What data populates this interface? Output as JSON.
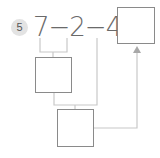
{
  "problem": {
    "number": "5",
    "expression": "7−2−4=",
    "operands": [
      "7",
      "2",
      "4"
    ],
    "operator": "−",
    "equals": "="
  },
  "boxes": {
    "result": "",
    "step1": "",
    "step2": ""
  },
  "colors": {
    "box_border": "#8a8a8a",
    "connector": "#c8c8c8",
    "badge_bg": "#e3e3e3",
    "text": "#6a6a6a"
  }
}
